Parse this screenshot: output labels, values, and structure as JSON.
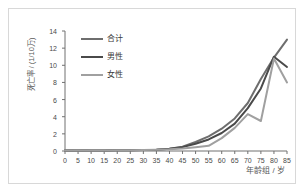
{
  "chart_data": {
    "type": "line",
    "title": "",
    "xlabel": "年龄组 / 岁",
    "ylabel": "死亡率 / (1/10万)",
    "xlim": [
      0,
      85
    ],
    "ylim": [
      0,
      14
    ],
    "grid": false,
    "legend_position": "upper-left",
    "x": [
      0,
      5,
      10,
      15,
      20,
      25,
      30,
      35,
      40,
      45,
      50,
      55,
      60,
      65,
      70,
      75,
      80,
      85
    ],
    "xticks": [
      "0",
      "5",
      "10",
      "15",
      "20",
      "25",
      "30",
      "35",
      "40",
      "45",
      "50",
      "55",
      "60",
      "65",
      "70",
      "75",
      "80",
      "85"
    ],
    "yticks": [
      "0",
      "2",
      "4",
      "6",
      "8",
      "10",
      "12",
      "14"
    ],
    "series": [
      {
        "name": "合计",
        "color": "#6e6e6e",
        "values": [
          0.05,
          0.08,
          0.05,
          0.05,
          0.08,
          0.1,
          0.12,
          0.15,
          0.25,
          0.5,
          1.05,
          1.7,
          2.6,
          3.8,
          5.6,
          8.4,
          10.9,
          13.0
        ]
      },
      {
        "name": "男性",
        "color": "#4a4a4a",
        "values": [
          0.05,
          0.08,
          0.05,
          0.05,
          0.08,
          0.1,
          0.12,
          0.15,
          0.25,
          0.45,
          0.85,
          1.35,
          2.1,
          3.2,
          5.0,
          7.3,
          11.0,
          9.8
        ]
      },
      {
        "name": "女性",
        "color": "#a0a0a0",
        "values": [
          0.05,
          0.08,
          0.05,
          0.05,
          0.08,
          0.1,
          0.12,
          0.15,
          0.2,
          0.3,
          0.45,
          0.6,
          1.5,
          2.7,
          4.3,
          3.5,
          10.8,
          8.0
        ]
      }
    ]
  }
}
